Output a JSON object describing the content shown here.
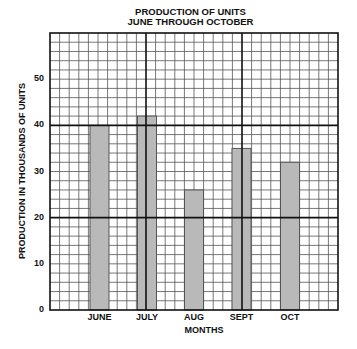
{
  "chart_data": {
    "type": "bar",
    "title": "PRODUCTION OF UNITS",
    "subtitle": "JUNE THROUGH OCTOBER",
    "categories": [
      "JUNE",
      "JULY",
      "AUG",
      "SEPT",
      "OCT"
    ],
    "values": [
      40,
      42,
      26,
      35,
      32
    ],
    "xlabel": "MONTHS",
    "ylabel": "PRODUCTION IN THOUSANDS OF UNITS",
    "ylim": [
      0,
      60
    ],
    "yticks": [
      "0",
      "10",
      "20",
      "30",
      "40",
      "50"
    ],
    "grid": true,
    "legend": null,
    "bar_color": "#b9b9b9",
    "bar_outline": "#555555",
    "grid_color": "#333333"
  }
}
